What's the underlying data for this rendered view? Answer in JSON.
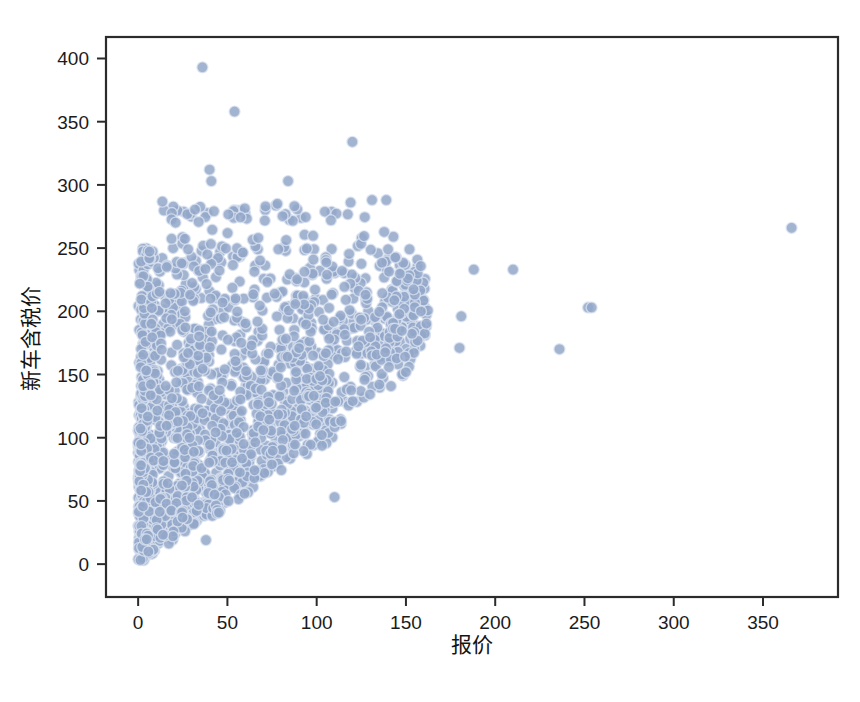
{
  "figure": {
    "background_color": "#ffffff",
    "frame_color": "#2b2b2b",
    "marker_color": "#93a7c9",
    "marker_edge_color": "#dce4f1",
    "text_color": "#1b1b1b"
  },
  "axes": {
    "x_title": "报价",
    "y_title": "新车含税价",
    "x_ticks": [
      "0",
      "50",
      "100",
      "150",
      "200",
      "250",
      "300",
      "350"
    ],
    "y_ticks": [
      "0",
      "50",
      "100",
      "150",
      "200",
      "250",
      "300",
      "350",
      "400"
    ]
  },
  "chart_data": {
    "type": "scatter",
    "title": "",
    "subtitle": "",
    "xlabel": "报价",
    "ylabel": "新车含税价",
    "xlim": [
      -18,
      392
    ],
    "ylim": [
      -26,
      417
    ],
    "xticks": [
      0,
      50,
      100,
      150,
      200,
      250,
      300,
      350
    ],
    "yticks": [
      0,
      50,
      100,
      150,
      200,
      250,
      300,
      350,
      400
    ],
    "grid": false,
    "legend": null,
    "marker": {
      "shape": "circle",
      "color": "#93a7c9",
      "edge_color": "#dce4f1",
      "size_px": 11,
      "alpha": 0.85
    },
    "notable_points": [
      {
        "x": 36,
        "y": 393
      },
      {
        "x": 54,
        "y": 358
      },
      {
        "x": 120,
        "y": 334
      },
      {
        "x": 40,
        "y": 312
      },
      {
        "x": 41,
        "y": 303
      },
      {
        "x": 84,
        "y": 303
      },
      {
        "x": 131,
        "y": 288
      },
      {
        "x": 139,
        "y": 288
      },
      {
        "x": 108,
        "y": 272
      },
      {
        "x": 78,
        "y": 285
      },
      {
        "x": 366,
        "y": 266
      },
      {
        "x": 188,
        "y": 233
      },
      {
        "x": 210,
        "y": 233
      },
      {
        "x": 252,
        "y": 203
      },
      {
        "x": 254,
        "y": 203
      },
      {
        "x": 236,
        "y": 170
      },
      {
        "x": 180,
        "y": 171
      },
      {
        "x": 181,
        "y": 196
      },
      {
        "x": 152,
        "y": 249
      },
      {
        "x": 140,
        "y": 249
      },
      {
        "x": 28,
        "y": 249
      },
      {
        "x": 110,
        "y": 53
      },
      {
        "x": 38,
        "y": 19
      }
    ],
    "series": [
      {
        "name": "观测点",
        "n_points": 1650,
        "x": [],
        "y": []
      }
    ]
  }
}
